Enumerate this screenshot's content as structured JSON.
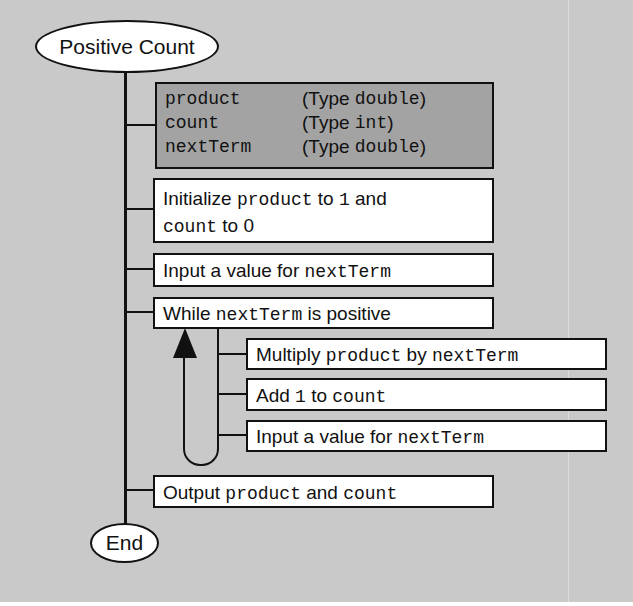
{
  "diagram": {
    "title": "Positive Count",
    "end_label": "End",
    "declarations": [
      {
        "name": "product",
        "type_prefix": "(Type ",
        "type": "double",
        "type_suffix": ")"
      },
      {
        "name": "count",
        "type_prefix": "(Type ",
        "type": "int",
        "type_suffix": ")"
      },
      {
        "name": "nextTerm",
        "type_prefix": "(Type ",
        "type": "double",
        "type_suffix": ")"
      }
    ],
    "steps": {
      "initialize": {
        "t1": "Initialize ",
        "v1": "product",
        "t2": " to ",
        "v2": "1",
        "t3": " and",
        "v3": "count",
        "t4": " to 0"
      },
      "input1": {
        "t1": "Input a value for ",
        "v1": "nextTerm"
      },
      "while": {
        "t1": "While ",
        "v1": "nextTerm",
        "t2": " is positive"
      },
      "loop_body": {
        "multiply": {
          "t1": "Multiply ",
          "v1": "product",
          "t2": " by ",
          "v2": "nextTerm"
        },
        "add": {
          "t1": "Add ",
          "v1": "1",
          "t2": " to ",
          "v2": "count"
        },
        "input2": {
          "t1": "Input a value for ",
          "v1": "nextTerm"
        }
      },
      "output": {
        "t1": "Output ",
        "v1": "product",
        "t2": " and ",
        "v2": "count"
      }
    },
    "colors": {
      "background": "#c9c9c9",
      "declaration_fill": "#a3a3a3",
      "box_fill": "#ffffff",
      "stroke": "#111111"
    }
  }
}
